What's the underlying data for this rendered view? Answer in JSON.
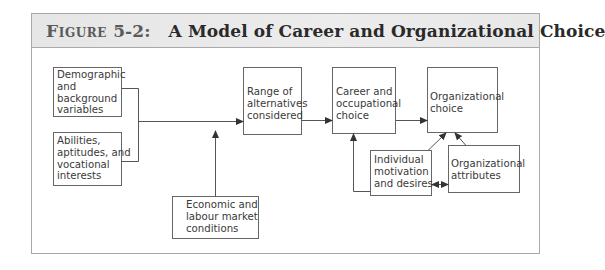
{
  "figure": {
    "label": "Figure",
    "number": "5-2:",
    "title": "A Model of Career and Organizational Choice"
  },
  "boxes": {
    "demographic": "Demographic\nand\nbackground\nvariables",
    "abilities": "Abilities,\naptitudes, and\nvocational\ninterests",
    "range": "Range of\nalternatives\nconsidered",
    "economic": "Economic and\nlabour market\nconditions",
    "career": "Career and\noccupational\nchoice",
    "org_choice": "Organizational\nchoice",
    "individual": "Individual\nmotivation\nand desires",
    "org_attributes": "Organizational\nattributes"
  },
  "edges": [
    {
      "from": "demographic",
      "to": "range"
    },
    {
      "from": "abilities",
      "to": "range"
    },
    {
      "from": "economic",
      "to": "range"
    },
    {
      "from": "range",
      "to": "career"
    },
    {
      "from": "career",
      "to": "org_choice"
    },
    {
      "from": "individual",
      "to": "career"
    },
    {
      "from": "individual",
      "to": "org_choice"
    },
    {
      "from": "org_attributes",
      "to": "org_choice"
    },
    {
      "from": "individual",
      "to": "org_attributes",
      "bidirectional": true
    }
  ],
  "colors": {
    "frame": "#a9a9a9",
    "title_band": "#e8e8e8",
    "line": "#555555",
    "text": "#3a3a3a"
  }
}
